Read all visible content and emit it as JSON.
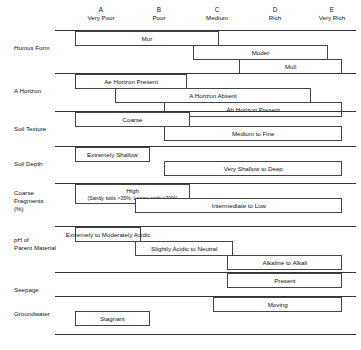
{
  "chart_data": {
    "type": "table",
    "title": "",
    "xlabel": "",
    "ylabel": "",
    "columns": [
      {
        "letter": "A",
        "name": "Very Poor"
      },
      {
        "letter": "B",
        "name": "Poor"
      },
      {
        "letter": "C",
        "name": "Medium"
      },
      {
        "letter": "D",
        "name": "Rich"
      },
      {
        "letter": "E",
        "name": "Very Rich"
      }
    ],
    "rows": [
      {
        "label": "Humus Form",
        "bars": [
          {
            "text": "Mor",
            "sub": "",
            "start": 0.0,
            "end": 2.5
          },
          {
            "text": "Moder",
            "sub": "",
            "start": 2.05,
            "end": 4.4
          },
          {
            "text": "Mull",
            "sub": "",
            "start": 2.85,
            "end": 4.65
          }
        ]
      },
      {
        "label": "A Horizon",
        "bars": [
          {
            "text": "Ae Horizon Present",
            "sub": "",
            "start": 0.0,
            "end": 1.95
          },
          {
            "text": "A Horizon Absent",
            "sub": "",
            "start": 0.7,
            "end": 4.1
          },
          {
            "text": "Ah Horizon Present",
            "sub": "",
            "start": 1.55,
            "end": 4.65
          }
        ]
      },
      {
        "label": "Soil Texture",
        "bars": [
          {
            "text": "Coarse",
            "sub": "",
            "start": 0.0,
            "end": 2.0
          },
          {
            "text": "Medium to Fine",
            "sub": "",
            "start": 1.55,
            "end": 4.65
          }
        ]
      },
      {
        "label": "Soil Depth",
        "bars": [
          {
            "text": "Extremely Shallow",
            "sub": "",
            "start": 0.0,
            "end": 1.3
          },
          {
            "text": "Very Shallow to Deep",
            "sub": "",
            "start": 1.55,
            "end": 4.65
          }
        ]
      },
      {
        "label": "Coarse\nFragments\n(%)",
        "bars": [
          {
            "text": "High",
            "sub": "(Sandy soils >35%; Loamy soils >70%)",
            "start": 0.0,
            "end": 2.0
          },
          {
            "text": "Intermediate to Low",
            "sub": "",
            "start": 1.05,
            "end": 4.65
          }
        ]
      },
      {
        "label": "pH of\nParent Material",
        "bars": [
          {
            "text": "Extremely to Moderately Acidic",
            "sub": "",
            "start": 0.0,
            "end": 1.15
          },
          {
            "text": "Slightly Acidic to Neutral",
            "sub": "",
            "start": 1.05,
            "end": 2.75
          },
          {
            "text": "Alkaline to Alkali",
            "sub": "",
            "start": 2.65,
            "end": 4.65
          }
        ]
      },
      {
        "label": "Seepage",
        "bars": [
          {
            "text": "Present",
            "sub": "",
            "start": 2.65,
            "end": 4.65
          }
        ]
      },
      {
        "label": "Groundwater",
        "bars": [
          {
            "text": "Moving",
            "sub": "",
            "start": 2.4,
            "end": 4.65
          },
          {
            "text": "Stagnant",
            "sub": "",
            "start": 0.0,
            "end": 1.3
          }
        ]
      }
    ]
  }
}
